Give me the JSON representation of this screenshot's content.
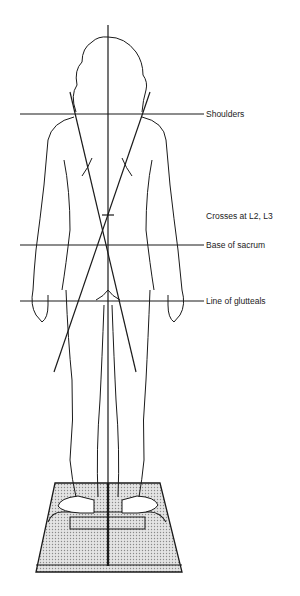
{
  "figure": {
    "labels": {
      "shoulders": "Shoulders",
      "crosses": "Crosses at L2, L3",
      "sacrum": "Base of sacrum",
      "glutteals": "Line of glutteals"
    },
    "colors": {
      "line": "#1a1a1a",
      "platform_fill": "#d6d6d6"
    }
  }
}
